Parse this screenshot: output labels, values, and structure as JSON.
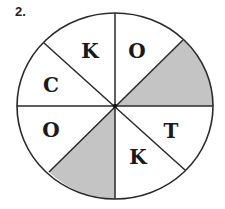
{
  "problem": {
    "number": "2."
  },
  "diagram": {
    "shape": "circle divided into 8 sectors",
    "center": [
      115,
      106
    ],
    "rx": 98,
    "ry": 93,
    "fill_color": "#ffffff",
    "shade_color": "#c4c4c4",
    "stroke_color": "#2a2a2a",
    "sectors": [
      {
        "position": "top-left-upper",
        "letter": "K",
        "shaded": false
      },
      {
        "position": "top-right-upper",
        "letter": "O",
        "shaded": false
      },
      {
        "position": "right-upper",
        "letter": "",
        "shaded": true
      },
      {
        "position": "right-lower",
        "letter": "T",
        "shaded": false
      },
      {
        "position": "bottom-right",
        "letter": "K",
        "shaded": false
      },
      {
        "position": "bottom-left",
        "letter": "",
        "shaded": true
      },
      {
        "position": "left-lower",
        "letter": "O",
        "shaded": false
      },
      {
        "position": "left-upper",
        "letter": "C",
        "shaded": false
      }
    ]
  }
}
